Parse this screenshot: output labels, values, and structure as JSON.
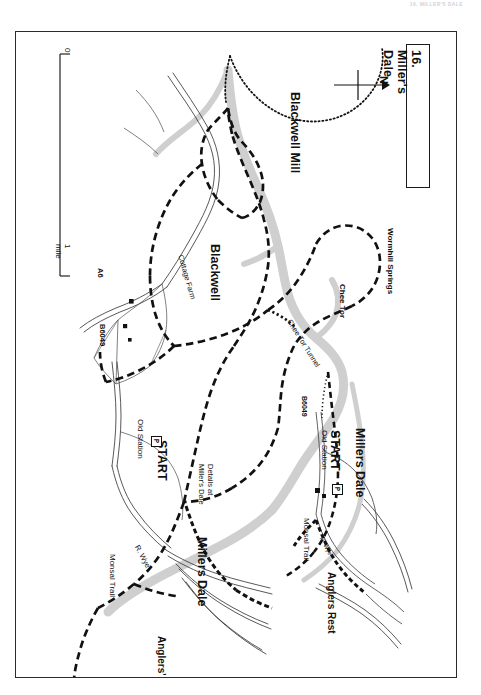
{
  "page": {
    "running_head": "16. MILLER'S DALE",
    "background": "#ffffff"
  },
  "title_box": {
    "label": "16. Miller's Dale"
  },
  "compass": {
    "label": "N",
    "direction": "arrow-right",
    "icon": "north-arrow-icon"
  },
  "scale_bar": {
    "zero_label": "0",
    "max_label": "1 mile",
    "unit": "mile"
  },
  "main_map": {
    "place_labels": [
      {
        "id": "blackwell-mill",
        "text": "Blackwell Mill",
        "size": "big"
      },
      {
        "id": "blackwell",
        "text": "Blackwell",
        "size": "big"
      },
      {
        "id": "cottage-farm",
        "text": "Cottage Farm",
        "size": "sml"
      },
      {
        "id": "wormhill-springs",
        "text": "Wormhill Springs",
        "size": "sml"
      },
      {
        "id": "chee-tor",
        "text": "Chee Tor",
        "size": "sml"
      },
      {
        "id": "chee-tor-tunnel",
        "text": "Chee Tor Tunnel",
        "size": "sml"
      },
      {
        "id": "millers-dale",
        "text": "Millers Dale",
        "size": "big"
      },
      {
        "id": "anglers-rest",
        "text": "Anglers' Rest",
        "size": "med"
      },
      {
        "id": "monsal-trail",
        "text": "Monsal Trail",
        "size": "sml"
      },
      {
        "id": "river-wye",
        "text": "R. Wye",
        "size": "sml"
      },
      {
        "id": "old-station",
        "text": "Old Station",
        "size": "sml"
      },
      {
        "id": "start",
        "text": "START",
        "size": "big"
      }
    ],
    "road_labels": [
      {
        "id": "a6",
        "text": "A6"
      },
      {
        "id": "b6049",
        "text": "B6049"
      }
    ],
    "parking_symbol": "P",
    "inset_note": "Details at\nMiller's Dale",
    "inset_note_line1": "Details at",
    "inset_note_line2": "Miller's Dale"
  },
  "inset_map": {
    "place_labels": [
      {
        "id": "inset-millers-dale",
        "text": "Millers Dale",
        "size": "big"
      },
      {
        "id": "inset-start",
        "text": "START",
        "size": "big"
      },
      {
        "id": "inset-old-station",
        "text": "Old Station",
        "size": "sml"
      },
      {
        "id": "inset-monsal-trail",
        "text": "Monsal Trail",
        "size": "sml"
      },
      {
        "id": "inset-anglers-rest",
        "text": "Anglers Rest",
        "size": "med"
      },
      {
        "id": "inset-river-wye",
        "text": "R. Wye",
        "size": "tiny"
      }
    ],
    "road_labels": [
      {
        "id": "inset-b6049",
        "text": "B6049"
      }
    ],
    "parking_symbol": "P"
  },
  "legend_semantics": {
    "route_style": "thick black dashed line = walking route",
    "railway_style": "dotted line = disused railway",
    "river_style": "grey band = river / water"
  },
  "colors": {
    "ink": "#111111",
    "frame": "#2b2b2b",
    "water": "#c9c9c9",
    "road_fill": "#ffffff",
    "paper": "#ffffff"
  }
}
